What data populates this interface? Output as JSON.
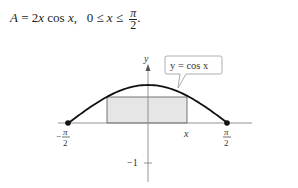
{
  "formula": {
    "lhs": "A",
    "eq": " = 2",
    "var1": "x",
    "cos": " cos ",
    "var2": "x",
    "comma": ",",
    "range_left": "0 ≤ ",
    "range_var": "x",
    "range_le": " ≤ ",
    "frac_num": "π",
    "frac_den": "2",
    "period": "."
  },
  "graph": {
    "y_axis_label": "y",
    "x_label": "x",
    "left_tick_num": "π",
    "left_tick_den": "2",
    "left_tick_sign": "−",
    "right_tick_num": "π",
    "right_tick_den": "2",
    "neg_one_label": "−1",
    "callout_text": "y = cos x",
    "curve": "y = cos x",
    "domain": [
      "-π/2",
      "π/2"
    ],
    "rectangle": {
      "x_from": "-x",
      "x_to": "x",
      "height": "cos x",
      "fill": "#e6e6e6"
    },
    "endpoints": [
      "(-π/2, 0)",
      "(π/2, 0)"
    ]
  }
}
